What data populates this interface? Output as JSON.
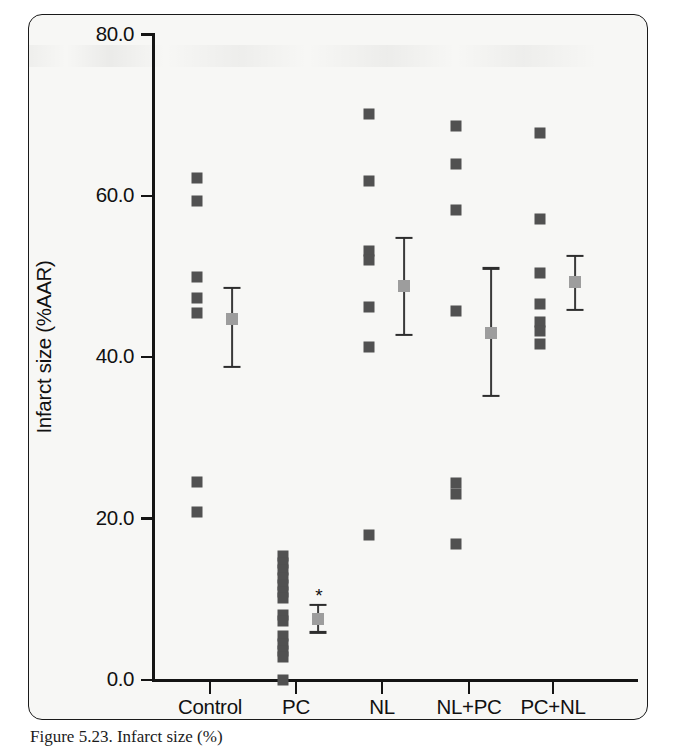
{
  "chart_data": {
    "type": "scatter",
    "title": "",
    "xlabel": "",
    "ylabel": "Infarct size (%AAR)",
    "ylim": [
      0.0,
      80.0
    ],
    "yticks": [
      0.0,
      20.0,
      40.0,
      60.0,
      80.0
    ],
    "ytick_labels": [
      "0.0",
      "20.0",
      "40.0",
      "60.0",
      "80.0"
    ],
    "categories": [
      "Control",
      "PC",
      "NL",
      "NL+PC",
      "PC+NL"
    ],
    "grid": false,
    "legend": false,
    "marker_style": "square",
    "annotations": [
      {
        "text": "*",
        "category": "PC",
        "value": 10.5,
        "meaning": "significant-vs-control"
      }
    ],
    "series": [
      {
        "name": "Control",
        "individual_values": [
          62.2,
          59.4,
          50.0,
          47.3,
          45.5,
          24.6,
          20.8
        ],
        "mean": 44.8,
        "error_upper": 48.6,
        "error_lower": 38.8,
        "significant": false
      },
      {
        "name": "PC",
        "individual_values": [
          15.4,
          14.5,
          13.6,
          12.7,
          11.8,
          10.9,
          10.2,
          8.1,
          7.3,
          5.4,
          4.5,
          3.6,
          2.9,
          0.0
        ],
        "mean": 7.6,
        "error_upper": 9.3,
        "error_lower": 5.9,
        "significant": true
      },
      {
        "name": "NL",
        "individual_values": [
          70.1,
          61.8,
          53.2,
          52.0,
          46.2,
          41.3,
          18.0
        ],
        "mean": 48.8,
        "error_upper": 54.8,
        "error_lower": 42.8,
        "significant": false
      },
      {
        "name": "NL+PC",
        "individual_values": [
          68.7,
          64.0,
          58.3,
          45.7,
          24.4,
          23.1,
          16.9
        ],
        "mean": 43.0,
        "error_upper": 51.0,
        "error_lower": 35.2,
        "significant": false
      },
      {
        "name": "PC+NL",
        "individual_values": [
          67.8,
          57.1,
          50.5,
          46.6,
          44.4,
          43.2,
          41.6
        ],
        "mean": 49.3,
        "error_upper": 52.6,
        "error_lower": 45.9,
        "significant": false
      }
    ],
    "colors": {
      "individual_marker": "#515151",
      "mean_marker": "#9d9d9d",
      "error_bar": "#3a3a3a",
      "axis": "#141414",
      "panel_background": "#f7f7f5"
    }
  },
  "caption": {
    "text": "Figure 5.23. Infarct size (%)"
  }
}
